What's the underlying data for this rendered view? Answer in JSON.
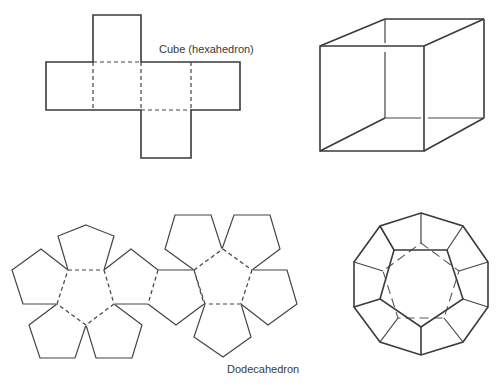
{
  "figure": {
    "cube": {
      "label": "Cube (hexahedron)",
      "net": {
        "outline": "M93,15 L141,15 L141,62 L240,62 L240,110 L191,110 L191,158 L141,158 L141,110 L46,110 L46,62 L93,62 Z",
        "folds": [
          "M93,62 L93,110",
          "M141,62 L141,110",
          "M191,62 L191,110",
          "M93,62 L141,62",
          "M141,110 L191,110"
        ]
      },
      "solid": {
        "front": "M320,46 L424,46 L424,151 L320,151 Z",
        "visible_edges": [
          "M320,46 L385,19",
          "M385,19 L484,19",
          "M424,46 L484,19",
          "M484,19 L484,118",
          "M424,151 L484,118",
          "M320,151 L385,118"
        ],
        "hidden_edges": [
          "M385,19 L385,43",
          "M385,52 L385,118",
          "M385,118 L421,118",
          "M428,118 L484,118"
        ]
      }
    },
    "dodecahedron": {
      "label": "Dodecahedron",
      "net": {
        "faces": [
          "M68,270 L104,270 L114,304 L86,325 L57,304 Z",
          "M86,225 L114,236 L104,270 L68,270 L58,236 Z",
          "M104,270 L131,249 L158,270 L148,304 L114,304 Z",
          "M68,270 L41,249 L12,270 L23,304 L57,304 Z",
          "M57,304 L86,325 L75,358 L40,358 L29,325 Z",
          "M114,304 L142,325 L132,358 L96,358 L86,325 Z",
          "M158,270 L194,270 L204,304 L176,325 L148,304 Z",
          "M223,249 L252,270 L241,304 L205,304 L194,270 Z",
          "M175,215 L211,215 L222,249 L194,270 L165,249 Z",
          "M234,215 L270,215 L280,249 L252,270 L222,249 Z",
          "M252,270 L287,270 L297,304 L268,325 L241,304 Z",
          "M205,304 L241,304 L251,337 L223,357 L194,337 Z"
        ],
        "folds": [
          "M68,270 L104,270",
          "M104,270 L114,304",
          "M114,304 L86,325",
          "M86,325 L57,304",
          "M57,304 L68,270",
          "M158,270 L148,304",
          "M194,270 L204,304",
          "M223,249 L252,270",
          "M252,270 L241,304",
          "M241,304 L205,304",
          "M205,304 L194,270",
          "M194,270 L223,249"
        ]
      },
      "solid": {
        "outer": "M421,213 L463,226 L488,262 L488,307 L463,342 L421,355 L380,342 L354,307 L354,262 L380,226 Z",
        "front_face": "M394,250 L447,250 L463,299 L421,327 L380,299 Z",
        "back_face": "M421,243 L459,271 L444,318 L398,318 L383,271 Z",
        "spokes": [
          "M421,213 L421,243",
          "M463,226 L447,250",
          "M488,262 L459,271",
          "M488,307 L463,299",
          "M463,342 L444,318",
          "M421,355 L421,327",
          "M380,342 L398,318",
          "M354,307 L380,299",
          "M354,262 L383,271",
          "M380,226 L394,250"
        ]
      }
    }
  }
}
